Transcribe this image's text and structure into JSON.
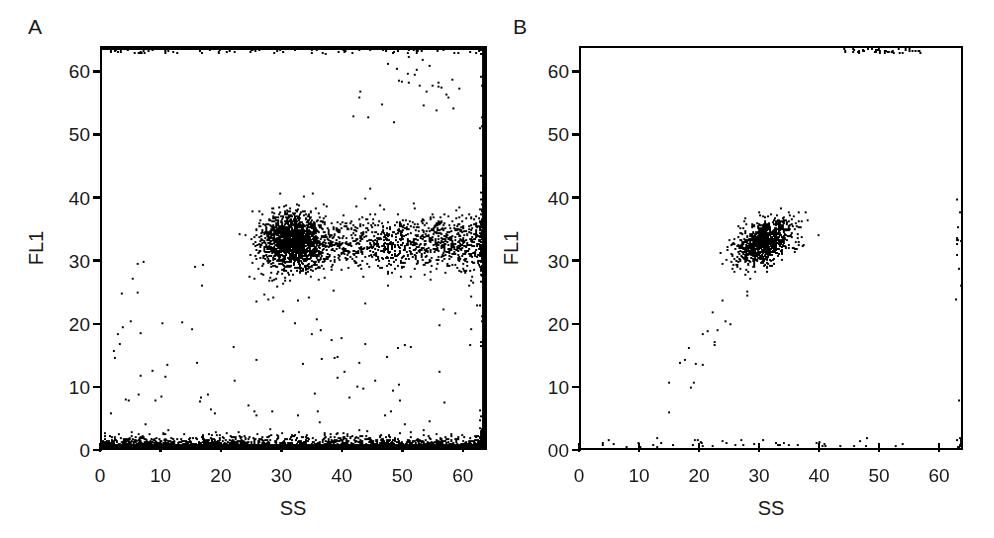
{
  "figure": {
    "kind": "flow-cytometry-dot-plots",
    "panels": [
      "A",
      "B"
    ]
  },
  "panel_a": {
    "letter": "A",
    "xlabel": "SS",
    "ylabel": "FL1",
    "xticks": [
      "0",
      "10",
      "20",
      "30",
      "40",
      "50",
      "60"
    ],
    "yticks": [
      "0",
      "10",
      "20",
      "30",
      "40",
      "50",
      "60"
    ]
  },
  "panel_b": {
    "letter": "B",
    "xlabel": "SS",
    "ylabel": "FL1",
    "xticks": [
      "0",
      "10",
      "20",
      "30",
      "40",
      "50",
      "60"
    ],
    "yticks": [
      "00",
      "10",
      "20",
      "30",
      "40",
      "50",
      "60"
    ]
  },
  "chart_data": [
    {
      "type": "scatter",
      "title": "A",
      "xlabel": "SS",
      "ylabel": "FL1",
      "xlim": [
        0,
        64
      ],
      "ylim": [
        0,
        64
      ],
      "xticks": [
        0,
        10,
        20,
        30,
        40,
        50,
        60
      ],
      "yticks": [
        0,
        10,
        20,
        30,
        40,
        50,
        60
      ],
      "grid": false,
      "legend": null,
      "point_color": "#000000",
      "description": "Dense saturated population along FL1=0 across all SS; broad horizontal positive band centered FL1~33 extending from SS~24 to the right channel edge; saturation pile-up along SS=64; sparse events at high FL1 near SS 45-55 and along the FL1=64 top edge.",
      "populations": [
        {
          "name": "fl1-negative-baseline",
          "approx_events": 1400,
          "x_range": [
            0,
            64
          ],
          "y_center": 0.4,
          "y_spread": 0.9,
          "density": "saturated"
        },
        {
          "name": "fl1-positive-band",
          "approx_events": 2600,
          "x_center": 32,
          "x_range": [
            24,
            64
          ],
          "y_center": 33,
          "y_spread": 2.2,
          "density": "dense-core-with-tail"
        },
        {
          "name": "ss-saturation-edge",
          "approx_events": 220,
          "x_center": 63.5,
          "y_range": [
            0,
            64
          ],
          "density": "pile-up"
        },
        {
          "name": "fl1-saturation-top",
          "approx_events": 90,
          "x_range": [
            0,
            64
          ],
          "y_center": 63.5,
          "density": "thin-line"
        },
        {
          "name": "high-fl1-scatter",
          "approx_events": 30,
          "x_range": [
            42,
            60
          ],
          "y_range": [
            52,
            63
          ],
          "density": "sparse"
        },
        {
          "name": "background-noise",
          "approx_events": 110,
          "x_range": [
            0,
            64
          ],
          "y_range": [
            2,
            30
          ],
          "density": "very-sparse"
        }
      ]
    },
    {
      "type": "scatter",
      "title": "B",
      "xlabel": "SS",
      "ylabel": "FL1",
      "xlim": [
        0,
        64
      ],
      "ylim": [
        0,
        64
      ],
      "xticks": [
        0,
        10,
        20,
        30,
        40,
        50,
        60
      ],
      "yticks": [
        0,
        10,
        20,
        30,
        40,
        50,
        60
      ],
      "grid": false,
      "legend": null,
      "point_color": "#000000",
      "description": "Single compact positive cluster centered at SS~31, FL1~33; thin sparse baseline near FL1=0 mostly at low SS; small cluster of saturated events on the FL1=64 top edge near SS 46-54; faint diagonal trail of sparse events from low-SS low-FL1 toward the main cluster.",
      "populations": [
        {
          "name": "main-positive-cluster",
          "approx_events": 900,
          "x_center": 31,
          "x_spread": 2.4,
          "y_center": 33,
          "y_spread": 1.8,
          "density": "dense"
        },
        {
          "name": "fl1-negative-baseline",
          "approx_events": 45,
          "x_range": [
            2,
            55
          ],
          "y_center": 0.6,
          "y_spread": 0.6,
          "density": "sparse"
        },
        {
          "name": "fl1-saturation-top",
          "approx_events": 45,
          "x_range": [
            44,
            58
          ],
          "y_center": 63.5,
          "density": "small-cluster"
        },
        {
          "name": "diagonal-trail",
          "approx_events": 22,
          "x_range": [
            13,
            30
          ],
          "y_range": [
            4,
            30
          ],
          "density": "very-sparse"
        },
        {
          "name": "ss-saturation-edge",
          "approx_events": 25,
          "x_center": 63.5,
          "y_range": [
            0,
            64
          ],
          "density": "thin-line"
        }
      ]
    }
  ]
}
